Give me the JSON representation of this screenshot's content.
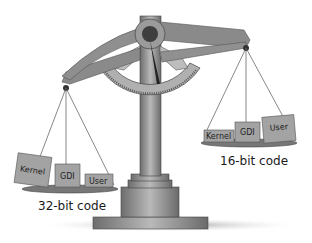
{
  "diagram": {
    "left_pan": {
      "caption": "32-bit code",
      "position": "lower",
      "blocks": [
        {
          "label": "Kernel",
          "size": "large"
        },
        {
          "label": "GDI",
          "size": "medium"
        },
        {
          "label": "User",
          "size": "small"
        }
      ]
    },
    "right_pan": {
      "caption": "16-bit code",
      "position": "higher",
      "blocks": [
        {
          "label": "Kernel",
          "size": "small"
        },
        {
          "label": "GDI",
          "size": "medium"
        },
        {
          "label": "User",
          "size": "large"
        }
      ]
    },
    "colors": {
      "beam": "#8a8a8a",
      "beam_dark": "#5e5e5e",
      "dial": "#a9a9a9",
      "block": "#9e9e9e",
      "pan": "#7a7a7a",
      "shadow": "#b5b5b5"
    }
  }
}
